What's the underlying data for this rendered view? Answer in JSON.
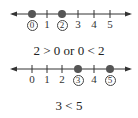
{
  "colors": {
    "line": "#333333",
    "dot": "#444444",
    "text": "#222222"
  },
  "number_lines": [
    {
      "ticks": [
        "0",
        "1",
        "2",
        "3",
        "4",
        "5"
      ],
      "highlighted": [
        0,
        2
      ],
      "expression": "2 > 0 or 0 < 2"
    },
    {
      "ticks": [
        "0",
        "1",
        "2",
        "3",
        "4",
        "5"
      ],
      "highlighted": [
        3,
        5
      ],
      "expression": "3 < 5"
    }
  ]
}
